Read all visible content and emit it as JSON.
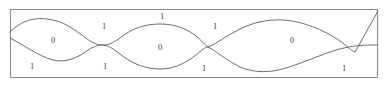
{
  "figure": {
    "title": "",
    "type": "region-labeled-curve-diagram",
    "frame": {
      "x": 10,
      "y": 9,
      "width": 368,
      "height": 69,
      "stroke_color": "#8a8a8a"
    },
    "curve_color": "#5b5b5b",
    "label_color": "#3a3a3a"
  },
  "labels": [
    {
      "id": "label-top-1",
      "text": "1",
      "x": 104,
      "y": 27
    },
    {
      "id": "label-top-2",
      "text": "1",
      "x": 162,
      "y": 17
    },
    {
      "id": "label-top-3",
      "text": "1",
      "x": 215,
      "y": 27
    },
    {
      "id": "label-lens-0-a",
      "text": "0",
      "x": 53,
      "y": 41
    },
    {
      "id": "label-lens-0-b",
      "text": "0",
      "x": 160,
      "y": 48
    },
    {
      "id": "label-lens-0-c",
      "text": "0",
      "x": 292,
      "y": 41
    },
    {
      "id": "label-bot-1",
      "text": "1",
      "x": 32,
      "y": 67
    },
    {
      "id": "label-bot-2",
      "text": "1",
      "x": 105,
      "y": 67
    },
    {
      "id": "label-bot-3",
      "text": "1",
      "x": 204,
      "y": 69
    },
    {
      "id": "label-bot-4",
      "text": "1",
      "x": 344,
      "y": 69
    }
  ],
  "curves": [
    {
      "id": "upper-curve",
      "name": "upper-boundary-curve",
      "path": "M 10,32 C 24,18 38,17 53,20 C 68,23 80,34 90,41 C 97,45 100,45 104,45 C 110,45 116,41 124,35 C 134,28 146,24 160,24 C 174,24 186,28 196,36 C 202,41 205,45 208,47 C 216,44 226,36 240,29 C 256,21 274,18 292,21 C 310,24 330,33 344,44 C 350,49 352,51 355,52 L 378,11"
    },
    {
      "id": "lower-curve",
      "name": "lower-boundary-curve",
      "path": "M 10,38 C 24,45 38,56 53,60 C 65,63 78,58 88,50 C 96,45 100,45 104,45 C 110,46 116,51 124,57 C 134,64 146,69 160,69 C 174,69 186,63 196,55 C 202,50 205,47 208,47 C 216,51 226,60 240,67 C 254,73 270,73 286,68 C 306,62 326,52 344,48 C 356,45 368,45 378,45"
    }
  ]
}
